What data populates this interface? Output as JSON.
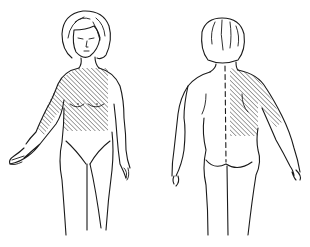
{
  "diagram": {
    "type": "body-pain-distribution-chart",
    "views": [
      {
        "id": "front",
        "label": "",
        "shaded_regions": [
          "right-shoulder",
          "right-upper-arm",
          "upper-chest"
        ]
      },
      {
        "id": "back",
        "label": "",
        "shaded_regions": [
          "left-upper-back",
          "left-shoulder",
          "left-upper-arm"
        ]
      }
    ],
    "colors": {
      "line": "#1a1a1a",
      "hatch": "#333333",
      "background": "#ffffff"
    }
  }
}
